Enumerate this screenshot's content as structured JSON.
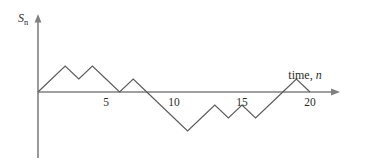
{
  "figure": {
    "background_color": "#ffffff",
    "axis_color": "#808080",
    "line_color": "#5a5a5a",
    "text_color": "#2b2b2b",
    "y_axis_label_main": "S",
    "y_axis_label_sub": "n",
    "x_axis_label_text": "time, ",
    "x_axis_label_var": "n"
  },
  "chart_data": {
    "type": "line",
    "title": "",
    "xlabel": "time, n",
    "ylabel": "S_n",
    "grid": false,
    "legend": null,
    "x": [
      0,
      1,
      2,
      3,
      4,
      5,
      6,
      7,
      8,
      9,
      10,
      11,
      12,
      13,
      14,
      15,
      16,
      17,
      18,
      19,
      20
    ],
    "values": [
      0,
      1,
      2,
      1,
      2,
      1,
      0,
      1,
      0,
      -1,
      -2,
      -3,
      -2,
      -1,
      -2,
      -1,
      -2,
      -1,
      0,
      1,
      0
    ],
    "steps": [
      1,
      1,
      -1,
      1,
      -1,
      -1,
      1,
      -1,
      -1,
      -1,
      -1,
      1,
      1,
      -1,
      1,
      -1,
      1,
      1,
      1,
      -1
    ],
    "xticks": [
      5,
      10,
      15,
      20
    ],
    "xtick_labels": [
      "5",
      "10",
      "15",
      "20"
    ],
    "yticks": [],
    "ytick_labels": [],
    "xlim": [
      0,
      21.5
    ],
    "ylim": [
      -4,
      3
    ]
  }
}
